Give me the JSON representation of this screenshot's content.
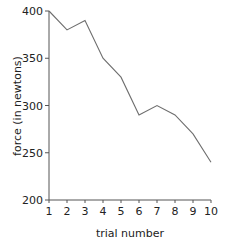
{
  "chart_data": {
    "type": "line",
    "title": "",
    "xlabel": "trial number",
    "ylabel": "force (in newtons)",
    "x": [
      1,
      2,
      3,
      4,
      5,
      6,
      7,
      8,
      9,
      10
    ],
    "series": [
      {
        "name": "force",
        "values": [
          400,
          380,
          390,
          350,
          330,
          290,
          300,
          290,
          270,
          240
        ]
      }
    ],
    "xlim": [
      1,
      10
    ],
    "ylim": [
      200,
      400
    ],
    "xticks": [
      "1",
      "2",
      "3",
      "4",
      "5",
      "6",
      "7",
      "8",
      "9",
      "10"
    ],
    "yticks": [
      "200",
      "250",
      "300",
      "350",
      "400"
    ],
    "grid": false,
    "legend": null,
    "line_color": "#6e6e6e",
    "axis_color": "#555555"
  }
}
